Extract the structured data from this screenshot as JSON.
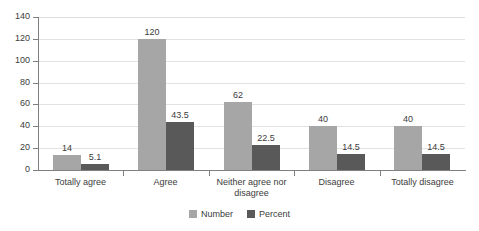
{
  "chart_data": {
    "type": "bar",
    "title": "",
    "xlabel": "",
    "ylabel": "",
    "ylim": [
      0,
      140
    ],
    "ytick_step": 20,
    "yticks": [
      "0",
      "20",
      "40",
      "60",
      "80",
      "100",
      "120",
      "140"
    ],
    "grid": true,
    "legend_position": "bottom",
    "categories": [
      "Totally agree",
      "Agree",
      "Neither agree nor disagree",
      "Disagree",
      "Totally disagree"
    ],
    "category_lines": [
      [
        "Totally agree"
      ],
      [
        "Agree"
      ],
      [
        "Neither agree nor",
        "disagree"
      ],
      [
        "Disagree"
      ],
      [
        "Totally disagree"
      ]
    ],
    "series": [
      {
        "name": "Number",
        "color": "#a6a6a6",
        "values": [
          14,
          120,
          62,
          40,
          40
        ],
        "labels": [
          "14",
          "120",
          "62",
          "40",
          "40"
        ]
      },
      {
        "name": "Percent",
        "color": "#595959",
        "values": [
          5.1,
          43.5,
          22.5,
          14.5,
          14.5
        ],
        "labels": [
          "5.1",
          "43.5",
          "22.5",
          "14.5",
          "14.5"
        ]
      }
    ]
  },
  "colors": {
    "number": "#a6a6a6",
    "percent": "#595959",
    "axis": "#7f7f7f",
    "grid": "#e2e2e2",
    "text": "#3c3c3c",
    "background": "#ffffff"
  }
}
